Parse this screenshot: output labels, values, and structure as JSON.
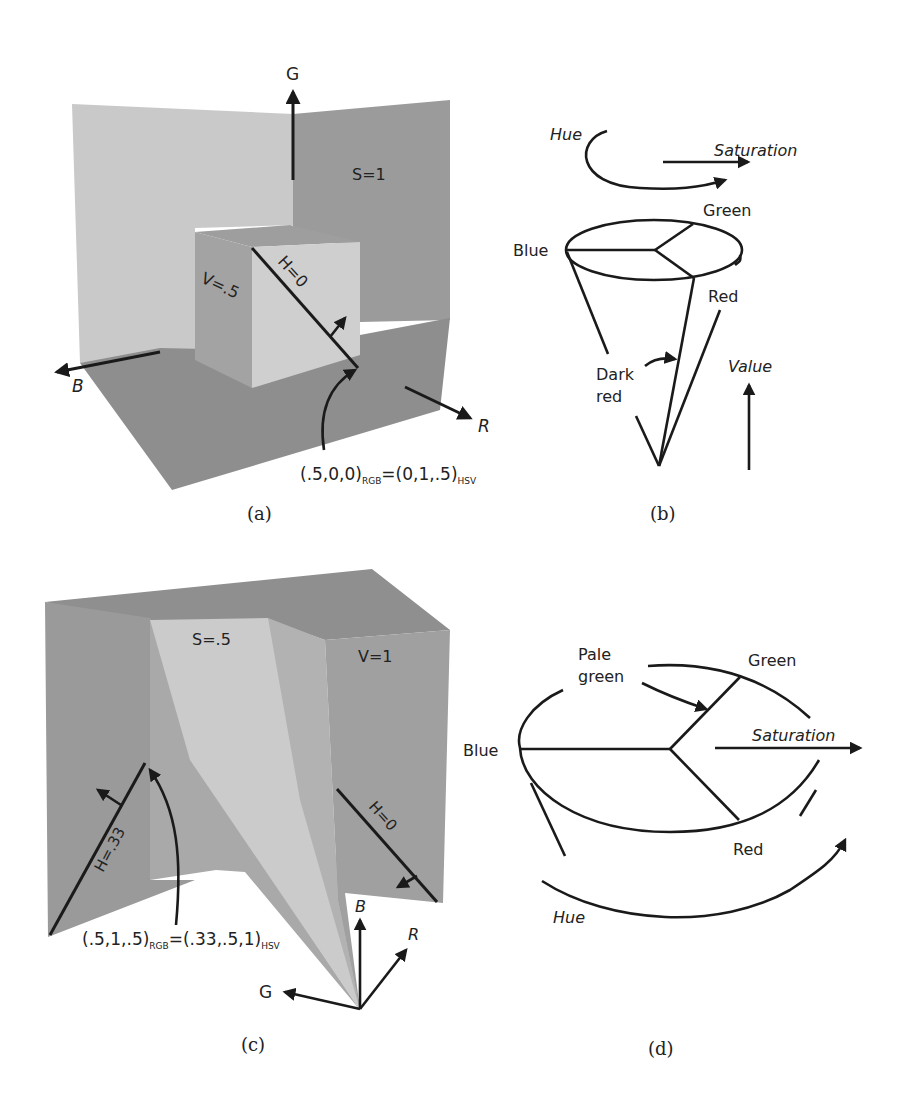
{
  "figure": {
    "panels": [
      {
        "id": "a",
        "caption": "(a)",
        "axis_labels": {
          "G": "G",
          "B": "B",
          "R": "R"
        },
        "plane_labels": {
          "saturation": "S=1",
          "value": "V=.5",
          "hue": "H=0"
        },
        "annotation": {
          "rgb": "(.5,0,0)",
          "rgb_sub": "RGB",
          "eq": "=",
          "hsv": "(0,1,.5)",
          "hsv_sub": "HSV"
        }
      },
      {
        "id": "b",
        "caption": "(b)",
        "labels": {
          "hue": "Hue",
          "saturation": "Saturation",
          "green": "Green",
          "blue": "Blue",
          "red": "Red",
          "dark_red_1": "Dark",
          "dark_red_2": "red",
          "value": "Value"
        }
      },
      {
        "id": "c",
        "caption": "(c)",
        "axis_labels": {
          "B": "B",
          "R": "R",
          "G": "G"
        },
        "plane_labels": {
          "saturation": "S=.5",
          "value": "V=1",
          "hue_0": "H=0",
          "hue_33": "H=.33"
        },
        "annotation": {
          "rgb": "(.5,1,.5)",
          "rgb_sub": "RGB",
          "eq": "=",
          "hsv": "(.33,.5,1)",
          "hsv_sub": "HSV"
        }
      },
      {
        "id": "d",
        "caption": "(d)",
        "labels": {
          "pale_1": "Pale",
          "pale_2": "green",
          "green": "Green",
          "blue": "Blue",
          "saturation": "Saturation",
          "red": "Red",
          "hue": "Hue"
        }
      }
    ],
    "colors": {
      "light_plane": "#c9c9c9",
      "mid_plane": "#a8a8a8",
      "dark_plane": "#959595",
      "floor": "#8e8e8e",
      "ink": "#1a1a1a",
      "paper": "#ffffff"
    }
  }
}
